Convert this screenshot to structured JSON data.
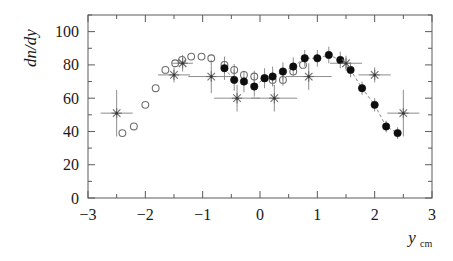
{
  "figure": {
    "title": "",
    "width": 453,
    "height": 261
  },
  "axes": {
    "x": {
      "label_main": "y",
      "label_sub": "cm",
      "min": -3,
      "max": 3,
      "major_ticks": [
        -3,
        -2,
        -1,
        0,
        1,
        2,
        3
      ],
      "major_tick_labels": [
        "−3",
        "−2",
        "−1",
        "0",
        "1",
        "2",
        "3"
      ],
      "minor_step": 0.5
    },
    "y": {
      "label": "dn/dy",
      "min": 0,
      "max": 110,
      "major_ticks": [
        0,
        20,
        40,
        60,
        80,
        100
      ],
      "major_tick_labels": [
        "0",
        "20",
        "40",
        "60",
        "80",
        "100"
      ],
      "minor_step": 10
    }
  },
  "style": {
    "frame_color": "#5a5a5a",
    "text_color": "#1a1a1a",
    "filled_color": "#0d0d0d",
    "open_color": "#6e6e6e",
    "star_color": "#6e6e6e",
    "errorbar_color": "#8d8d8d",
    "connector_color": "#7a7a7a",
    "background": "#ffffff"
  },
  "chart_data": {
    "type": "scatter",
    "title": "",
    "xlabel": "y_cm",
    "ylabel": "dn/dy",
    "xlim": [
      -3,
      3
    ],
    "ylim": [
      0,
      110
    ],
    "grid": false,
    "legend": "none",
    "series": [
      {
        "name": "open-circles",
        "marker": "open-circle",
        "x": [
          -2.4,
          -2.2,
          -2.0,
          -1.82,
          -1.65,
          -1.48,
          -1.36,
          -1.2,
          -1.02,
          -0.85,
          -0.62,
          -0.45,
          -0.28,
          -0.1,
          0.08,
          0.22,
          0.4,
          0.58,
          0.75
        ],
        "y": [
          39,
          43,
          56,
          66,
          77,
          81,
          83,
          85,
          85,
          84,
          80,
          77,
          74,
          73,
          72,
          71,
          71,
          76,
          80
        ],
        "yerr": [
          0,
          0,
          0,
          0,
          0,
          0,
          0,
          0,
          0,
          0,
          0,
          3.5,
          0,
          3.5,
          0,
          3.5,
          3.5,
          0,
          0
        ]
      },
      {
        "name": "filled-circles",
        "marker": "filled-circle",
        "x": [
          -0.62,
          -0.45,
          -0.28,
          -0.1,
          0.08,
          0.22,
          0.4,
          0.58,
          0.78,
          1.0,
          1.2,
          1.4,
          1.58,
          1.78,
          2.0,
          2.2,
          2.4
        ],
        "y": [
          78,
          71,
          70,
          67,
          72,
          73,
          76,
          79,
          84,
          84,
          86,
          83,
          77,
          66,
          56,
          43,
          39
        ],
        "yerr": [
          7,
          6.5,
          6.5,
          6,
          6,
          6,
          5.5,
          5.5,
          5,
          5,
          5,
          5,
          4.5,
          4,
          4,
          3.5,
          3.5
        ]
      },
      {
        "name": "star-points",
        "marker": "star",
        "x": [
          -2.5,
          -1.5,
          -1.35,
          -0.85,
          -0.4,
          0.25,
          0.85,
          1.5,
          2.0,
          2.5
        ],
        "y": [
          51,
          74,
          81,
          73,
          60,
          60,
          73,
          81,
          74,
          51
        ],
        "yerr": [
          14,
          4.5,
          5,
          10,
          8,
          8,
          8,
          4.5,
          4.5,
          14
        ],
        "xerr": [
          0.28,
          0.28,
          0.18,
          0.4,
          0.4,
          0.4,
          0.4,
          0.28,
          0.28,
          0.28
        ]
      }
    ]
  }
}
